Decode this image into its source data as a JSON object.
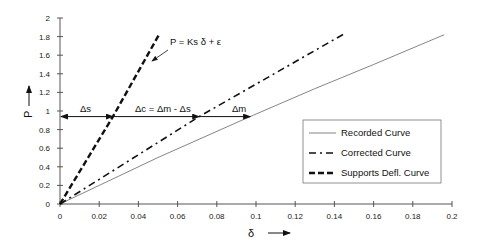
{
  "chart_data": {
    "type": "line",
    "title": "",
    "xlabel": "δ",
    "ylabel": "P",
    "xlim": [
      0,
      0.2
    ],
    "ylim": [
      0,
      2
    ],
    "grid": false,
    "legend_position": "lower right (inside)",
    "x_ticks": [
      "0",
      "0.02",
      "0.04",
      "0.06",
      "0.08",
      "0.1",
      "0.12",
      "0.14",
      "0.16",
      "0.18",
      "0.2"
    ],
    "y_ticks": [
      "0",
      "0.2",
      "0.4",
      "0.6",
      "0.8",
      "1",
      "1.2",
      "1.4",
      "1.6",
      "1.8",
      "2"
    ],
    "series": [
      {
        "name": "Recorded Curve",
        "style": "solid-thin",
        "x": [
          0,
          0.02,
          0.05,
          0.097,
          0.13,
          0.16,
          0.196
        ],
        "y": [
          0,
          0.2,
          0.5,
          0.94,
          1.24,
          1.5,
          1.82
        ]
      },
      {
        "name": "Corrected Curve",
        "style": "dash-dot",
        "x": [
          0,
          0.071,
          0.145
        ],
        "y": [
          0,
          0.94,
          1.83
        ]
      },
      {
        "name": "Supports Defl. Curve",
        "style": "dashed-thick",
        "x": [
          0,
          0.027,
          0.0505
        ],
        "y": [
          0,
          0.94,
          1.82
        ]
      }
    ],
    "annotations": [
      {
        "text": "P = Ks δ + ε",
        "x": 0.076,
        "y": 1.68,
        "arrow_to": [
          0.048,
          1.6
        ]
      },
      {
        "text": "Δs",
        "type": "double-arrow",
        "from": [
          0,
          0.94
        ],
        "to": [
          0.027,
          0.94
        ]
      },
      {
        "text": "Δc = Δm - Δs",
        "type": "arrow",
        "from": [
          0.027,
          0.94
        ],
        "to": [
          0.071,
          0.94
        ]
      },
      {
        "text": "Δm",
        "type": "arrow",
        "from": [
          0.071,
          0.94
        ],
        "to": [
          0.097,
          0.94
        ]
      }
    ]
  },
  "labels": {
    "x_axis": "δ",
    "y_axis": "P",
    "equation": "P = Ks δ + ε",
    "delta_s": "Δs",
    "delta_c": "Δc = Δm - Δs",
    "delta_m": "Δm"
  },
  "legend": [
    {
      "label": "Recorded Curve"
    },
    {
      "label": "Corrected Curve"
    },
    {
      "label": "Supports Defl. Curve"
    }
  ]
}
